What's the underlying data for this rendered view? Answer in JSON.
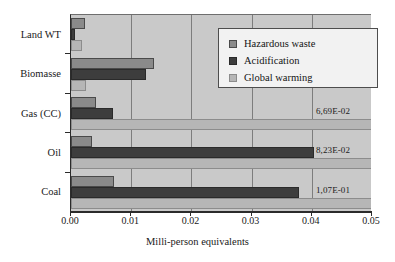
{
  "chart_data": {
    "type": "bar",
    "orientation": "horizontal",
    "title": "",
    "xlabel": "Milli-person equivalents",
    "ylabel": "",
    "xlim": [
      0.0,
      0.05
    ],
    "xticks": [
      "0.00",
      "0.01",
      "0.02",
      "0.03",
      "0.04",
      "0.05"
    ],
    "xtick_values": [
      0.0,
      0.01,
      0.02,
      0.03,
      0.04,
      0.05
    ],
    "grid": true,
    "legend_position": "upper right",
    "categories": [
      "Land WT",
      "Biomasse",
      "Gas (CC)",
      "Oil",
      "Coal"
    ],
    "series": [
      {
        "name": "Hazardous waste",
        "color": "#8a8a8a",
        "values": [
          0.0023,
          0.0138,
          0.0042,
          0.0035,
          0.0072
        ]
      },
      {
        "name": "Acidification",
        "color": "#3d3d3d",
        "values": [
          0.0006,
          0.0125,
          0.007,
          0.0403,
          0.0378
        ]
      },
      {
        "name": "Global warming",
        "color": "#b6b6b6",
        "values": [
          0.0018,
          0.0025,
          0.0669,
          0.0823,
          0.107
        ]
      }
    ],
    "overflow_labels": [
      {
        "category": "Gas (CC)",
        "series": "Global warming",
        "text": "6,69E-02"
      },
      {
        "category": "Oil",
        "series": "Global warming",
        "text": "8,23E-02"
      },
      {
        "category": "Coal",
        "series": "Global warming",
        "text": "1,07E-01"
      }
    ]
  },
  "legend": {
    "items": [
      {
        "label": "Hazardous waste",
        "swatch": "s0"
      },
      {
        "label": "Acidification",
        "swatch": "s1"
      },
      {
        "label": "Global warming",
        "swatch": "s2"
      }
    ]
  }
}
